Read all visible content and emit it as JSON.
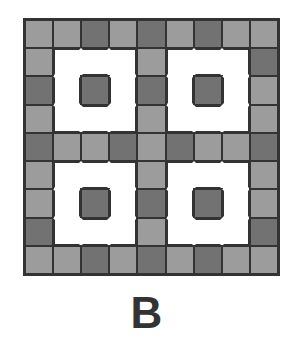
{
  "figure": {
    "label": "B",
    "grid_size": 9,
    "colors": {
      "light": "#9c9c9c",
      "dark": "#727272",
      "white": "#ffffff",
      "line": "#333333"
    },
    "legend_codes": {
      "L": "light gray tile",
      "D": "dark gray tile",
      "W": "white (empty) area"
    },
    "rows": [
      [
        "L",
        "L",
        "D",
        "L",
        "D",
        "L",
        "D",
        "L",
        "L"
      ],
      [
        "L",
        "W",
        "W",
        "W",
        "L",
        "W",
        "W",
        "W",
        "D"
      ],
      [
        "D",
        "W",
        "D",
        "W",
        "D",
        "W",
        "D",
        "W",
        "L"
      ],
      [
        "L",
        "W",
        "W",
        "W",
        "L",
        "W",
        "W",
        "W",
        "L"
      ],
      [
        "D",
        "L",
        "L",
        "D",
        "L",
        "D",
        "L",
        "L",
        "D"
      ],
      [
        "L",
        "W",
        "W",
        "W",
        "L",
        "W",
        "W",
        "W",
        "L"
      ],
      [
        "L",
        "W",
        "D",
        "W",
        "D",
        "W",
        "D",
        "W",
        "L"
      ],
      [
        "D",
        "W",
        "W",
        "W",
        "L",
        "W",
        "W",
        "W",
        "D"
      ],
      [
        "L",
        "L",
        "D",
        "L",
        "D",
        "L",
        "D",
        "L",
        "L"
      ]
    ]
  }
}
